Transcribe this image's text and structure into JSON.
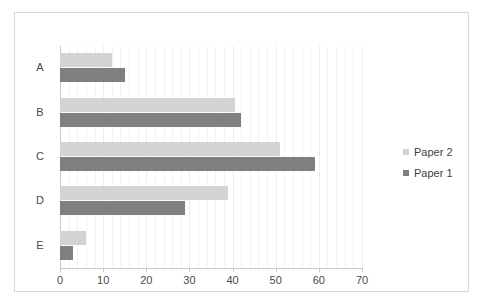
{
  "chart_data": {
    "type": "bar",
    "orientation": "horizontal",
    "title": "",
    "xlabel": "",
    "ylabel": "",
    "categories": [
      "A",
      "B",
      "C",
      "D",
      "E"
    ],
    "series": [
      {
        "name": "Paper 2",
        "color": "#d3d3d3",
        "values": [
          12,
          40.5,
          51,
          39,
          6
        ]
      },
      {
        "name": "Paper 1",
        "color": "#7f7f7f",
        "values": [
          15,
          42,
          59,
          29,
          3
        ]
      }
    ],
    "xlim": [
      0,
      70
    ],
    "xticks": [
      0,
      10,
      20,
      30,
      40,
      50,
      60,
      70
    ],
    "xticklabels": [
      "0",
      "10",
      "20",
      "30",
      "40",
      "50",
      "60",
      "70"
    ],
    "grid": true,
    "grid_axis": "x",
    "minor_grid_step": 2,
    "legend_position": "right"
  }
}
